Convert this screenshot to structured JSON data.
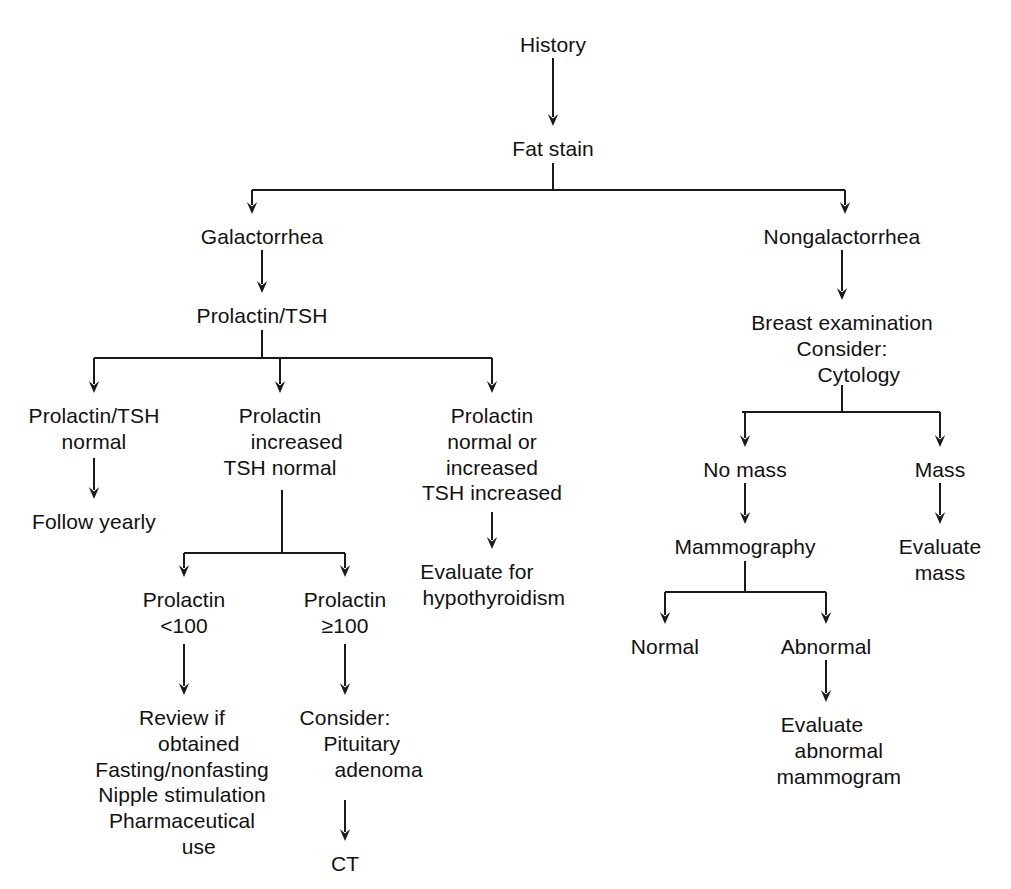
{
  "diagram": {
    "type": "flowchart",
    "background": "#ffffff",
    "line_color": "#1a1a1a",
    "text_color": "#111111"
  },
  "nodes": {
    "history": {
      "label": "History",
      "x": 553,
      "y": 32,
      "align": "c"
    },
    "fat_stain": {
      "label": "Fat stain",
      "x": 553,
      "y": 136,
      "align": "c"
    },
    "galactorrhea": {
      "label": "Galactorrhea",
      "x": 262,
      "y": 224,
      "align": "c"
    },
    "nongalactorrhea": {
      "label": "Nongalactorrhea",
      "x": 842,
      "y": 224,
      "align": "c"
    },
    "prolactin_tsh": {
      "label": "Prolactin/TSH",
      "x": 262,
      "y": 303,
      "align": "c"
    },
    "breast_exam": {
      "lines": [
        "Breast examination",
        "Consider:",
        "Cytology"
      ],
      "indents": [
        0,
        0,
        1
      ],
      "x": 842,
      "y": 310,
      "align": "c"
    },
    "prolactin_tsh_normal": {
      "lines": [
        "Prolactin/TSH",
        "normal"
      ],
      "indents": [
        0,
        0
      ],
      "x": 94,
      "y": 403,
      "align": "c"
    },
    "follow_yearly": {
      "label": "Follow yearly",
      "x": 94,
      "y": 509,
      "align": "c"
    },
    "prolactin_increased": {
      "lines": [
        "Prolactin",
        "increased",
        "TSH normal"
      ],
      "indents": [
        0,
        1,
        0
      ],
      "x": 280,
      "y": 403,
      "align": "c"
    },
    "prolactin_normal_or_increased": {
      "lines": [
        "Prolactin",
        "normal or",
        "increased",
        "TSH increased"
      ],
      "indents": [
        0,
        0,
        0,
        0
      ],
      "x": 492,
      "y": 403,
      "align": "c"
    },
    "evaluate_hypothyroidism": {
      "lines": [
        "Evaluate for",
        "hypothyroidism"
      ],
      "indents": [
        0,
        1
      ],
      "x": 477,
      "y": 559,
      "align": "c"
    },
    "prolactin_lt_100": {
      "lines": [
        "Prolactin",
        "<100"
      ],
      "indents": [
        0,
        0
      ],
      "x": 184,
      "y": 587,
      "align": "c"
    },
    "prolactin_ge_100": {
      "lines": [
        "Prolactin",
        "≥100"
      ],
      "indents": [
        0,
        0
      ],
      "x": 345,
      "y": 587,
      "align": "c"
    },
    "review_if_obtained": {
      "lines": [
        "Review if",
        "obtained",
        "Fasting/nonfasting",
        "Nipple stimulation",
        "Pharmaceutical",
        "use"
      ],
      "indents": [
        0,
        1,
        0,
        0,
        0,
        1
      ],
      "x": 182,
      "y": 705,
      "align": "c"
    },
    "consider_pituitary_adenoma": {
      "lines": [
        "Consider:",
        "Pituitary",
        "adenoma"
      ],
      "indents": [
        0,
        1,
        2
      ],
      "x": 345,
      "y": 705,
      "align": "c"
    },
    "ct": {
      "label": "CT",
      "x": 345,
      "y": 851,
      "align": "c"
    },
    "no_mass": {
      "label": "No mass",
      "x": 745,
      "y": 457,
      "align": "c"
    },
    "mass": {
      "label": "Mass",
      "x": 940,
      "y": 457,
      "align": "c"
    },
    "mammography": {
      "label": "Mammography",
      "x": 745,
      "y": 534,
      "align": "c"
    },
    "evaluate_mass": {
      "lines": [
        "Evaluate",
        "mass"
      ],
      "indents": [
        0,
        0
      ],
      "x": 940,
      "y": 534,
      "align": "c"
    },
    "normal": {
      "label": "Normal",
      "x": 665,
      "y": 634,
      "align": "c"
    },
    "abnormal": {
      "label": "Abnormal",
      "x": 826,
      "y": 634,
      "align": "c"
    },
    "evaluate_abnormal_mammogram": {
      "lines": [
        "Evaluate",
        "abnormal",
        "mammogram"
      ],
      "indents": [
        0,
        1,
        1
      ],
      "x": 822,
      "y": 712,
      "align": "c"
    }
  },
  "edges": [
    {
      "name": "history-to-fat-stain",
      "kind": "arrow",
      "x1": 553,
      "y1": 58,
      "x2": 553,
      "y2": 126
    },
    {
      "name": "fat-stain-stem",
      "kind": "line",
      "x1": 553,
      "y1": 163,
      "x2": 553,
      "y2": 190
    },
    {
      "name": "fat-stain-split-bar",
      "kind": "line",
      "x1": 252,
      "y1": 190,
      "x2": 845,
      "y2": 190
    },
    {
      "name": "fat-stain-to-galactorrhea",
      "kind": "arrow",
      "x1": 252,
      "y1": 190,
      "x2": 252,
      "y2": 214
    },
    {
      "name": "fat-stain-to-nongalactorrhea",
      "kind": "arrow",
      "x1": 845,
      "y1": 190,
      "x2": 845,
      "y2": 214
    },
    {
      "name": "galactorrhea-to-prolactin-tsh",
      "kind": "arrow",
      "x1": 262,
      "y1": 250,
      "x2": 262,
      "y2": 293
    },
    {
      "name": "prolactin-tsh-stem",
      "kind": "line",
      "x1": 262,
      "y1": 330,
      "x2": 262,
      "y2": 358
    },
    {
      "name": "prolactin-tsh-split-bar",
      "kind": "line",
      "x1": 94,
      "y1": 358,
      "x2": 492,
      "y2": 358
    },
    {
      "name": "to-prolactin-tsh-normal",
      "kind": "arrow",
      "x1": 94,
      "y1": 358,
      "x2": 94,
      "y2": 393
    },
    {
      "name": "to-prolactin-increased",
      "kind": "arrow",
      "x1": 280,
      "y1": 358,
      "x2": 280,
      "y2": 393
    },
    {
      "name": "to-prolactin-normal-or-increased",
      "kind": "arrow",
      "x1": 492,
      "y1": 358,
      "x2": 492,
      "y2": 393
    },
    {
      "name": "prolactin-tsh-normal-to-follow-yearly",
      "kind": "arrow",
      "x1": 94,
      "y1": 458,
      "x2": 94,
      "y2": 499
    },
    {
      "name": "prolactin-increased-stem",
      "kind": "line",
      "x1": 282,
      "y1": 490,
      "x2": 282,
      "y2": 553
    },
    {
      "name": "prolactin-increased-split-bar",
      "kind": "line",
      "x1": 184,
      "y1": 553,
      "x2": 345,
      "y2": 553
    },
    {
      "name": "to-prolactin-lt-100",
      "kind": "arrow",
      "x1": 184,
      "y1": 553,
      "x2": 184,
      "y2": 577
    },
    {
      "name": "to-prolactin-ge-100",
      "kind": "arrow",
      "x1": 345,
      "y1": 553,
      "x2": 345,
      "y2": 577
    },
    {
      "name": "prolactin-normal-to-evaluate-hypothyroidism",
      "kind": "arrow",
      "x1": 492,
      "y1": 512,
      "x2": 492,
      "y2": 549
    },
    {
      "name": "prolactin-lt-100-to-review",
      "kind": "arrow",
      "x1": 184,
      "y1": 644,
      "x2": 184,
      "y2": 695
    },
    {
      "name": "prolactin-ge-100-to-consider",
      "kind": "arrow",
      "x1": 345,
      "y1": 644,
      "x2": 345,
      "y2": 695
    },
    {
      "name": "consider-to-ct",
      "kind": "arrow",
      "x1": 345,
      "y1": 800,
      "x2": 345,
      "y2": 841
    },
    {
      "name": "nongalactorrhea-to-breast-exam",
      "kind": "arrow",
      "x1": 842,
      "y1": 250,
      "x2": 842,
      "y2": 300
    },
    {
      "name": "cytology-stem",
      "kind": "line",
      "x1": 842,
      "y1": 385,
      "x2": 842,
      "y2": 412
    },
    {
      "name": "cytology-split-bar",
      "kind": "line",
      "x1": 742,
      "y1": 412,
      "x2": 940,
      "y2": 412
    },
    {
      "name": "to-no-mass",
      "kind": "arrow",
      "x1": 745,
      "y1": 412,
      "x2": 745,
      "y2": 447
    },
    {
      "name": "to-mass",
      "kind": "arrow",
      "x1": 940,
      "y1": 412,
      "x2": 940,
      "y2": 447
    },
    {
      "name": "no-mass-to-mammography",
      "kind": "arrow",
      "x1": 745,
      "y1": 483,
      "x2": 745,
      "y2": 524
    },
    {
      "name": "mass-to-evaluate-mass",
      "kind": "arrow",
      "x1": 940,
      "y1": 483,
      "x2": 940,
      "y2": 524
    },
    {
      "name": "mammography-stem",
      "kind": "line",
      "x1": 745,
      "y1": 561,
      "x2": 745,
      "y2": 592
    },
    {
      "name": "mammography-split-bar",
      "kind": "line",
      "x1": 665,
      "y1": 592,
      "x2": 826,
      "y2": 592
    },
    {
      "name": "to-normal",
      "kind": "arrow",
      "x1": 665,
      "y1": 592,
      "x2": 665,
      "y2": 624
    },
    {
      "name": "to-abnormal",
      "kind": "arrow",
      "x1": 826,
      "y1": 592,
      "x2": 826,
      "y2": 624
    },
    {
      "name": "abnormal-to-evaluate-abnormal-mammogram",
      "kind": "arrow",
      "x1": 826,
      "y1": 660,
      "x2": 826,
      "y2": 702
    }
  ]
}
